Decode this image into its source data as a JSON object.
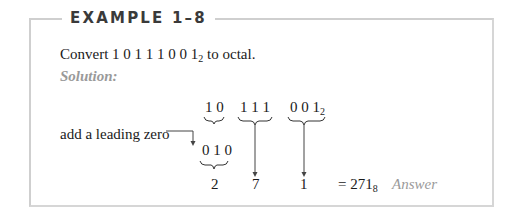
{
  "example": {
    "header": "EXAMPLE 1–8",
    "problem": {
      "prefix": "Convert ",
      "binary": "1 0 1 1 1 0 0 1",
      "base": "2",
      "suffix": " to octal."
    },
    "solution_label": "Solution:",
    "groups": {
      "group1": "1 0",
      "group2": "1 1 1",
      "group3": "0 0 1",
      "group3_base": "2",
      "padded_group1": "0 1 0"
    },
    "annotation": "add a leading zero",
    "octal_digits": [
      "2",
      "7",
      "1"
    ],
    "result": {
      "prefix": "= ",
      "value": "271",
      "base": "8",
      "label": "Answer"
    }
  },
  "colors": {
    "border": "#cfcfcf",
    "header_text": "#3a3a3a",
    "body_text": "#1a1a1a",
    "accent_gray": "#9a9a9a"
  }
}
